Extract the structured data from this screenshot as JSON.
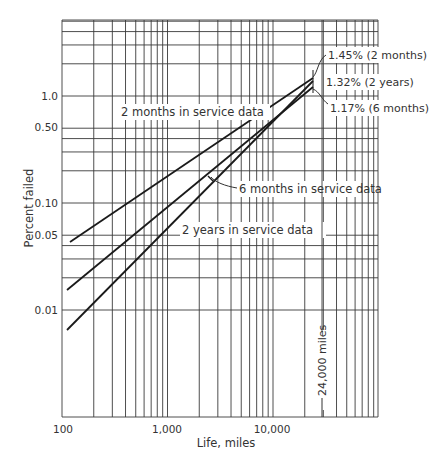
{
  "chart_data": {
    "type": "line",
    "title": "",
    "xlabel": "Life, miles",
    "ylabel": "Percent failed",
    "xscale": "log",
    "yscale": "log",
    "xlim": [
      100,
      100000
    ],
    "ylim": [
      0.001,
      5.0
    ],
    "grid": true,
    "x_tick_labels": [
      "100",
      "1,000",
      "10,000"
    ],
    "y_tick_labels": [
      "1.0",
      "0.50",
      "0.10",
      "0.05",
      "0.01"
    ],
    "series": [
      {
        "name": "2 months in service data",
        "x": [
          120,
          24000
        ],
        "y": [
          0.043,
          1.45
        ]
      },
      {
        "name": "6 months in service data",
        "x": [
          115,
          24000
        ],
        "y": [
          0.0145,
          1.17
        ]
      },
      {
        "name": "2 years in service data",
        "x": [
          115,
          24000
        ],
        "y": [
          0.0055,
          1.32
        ]
      }
    ],
    "annotations": [
      {
        "text": "1.45% (2 months)",
        "x": 24000,
        "y": 1.45
      },
      {
        "text": "1.32% (2 years)",
        "x": 24000,
        "y": 1.32
      },
      {
        "text": "1.17% (6 months)",
        "x": 24000,
        "y": 1.17
      },
      {
        "text": "24,000 miles",
        "x": 24000,
        "orientation": "vertical"
      }
    ]
  },
  "labels": {
    "series_a": "2 months in service data",
    "series_b": "6 months in service data",
    "series_c": "2 years in service data",
    "ann_a": "1.45% (2 months)",
    "ann_b": "1.32% (2 years)",
    "ann_c": "1.17% (6 months)",
    "ann_miles": "24,000 miles",
    "xlabel": "Life, miles",
    "ylabel": "Percent failed",
    "xt100": "100",
    "xt1000": "1,000",
    "xt10000": "10,000",
    "yt1": "1.0",
    "yt05": "0.50",
    "yt01": "0.10",
    "yt005": "0.05",
    "yt001": "0.01"
  }
}
